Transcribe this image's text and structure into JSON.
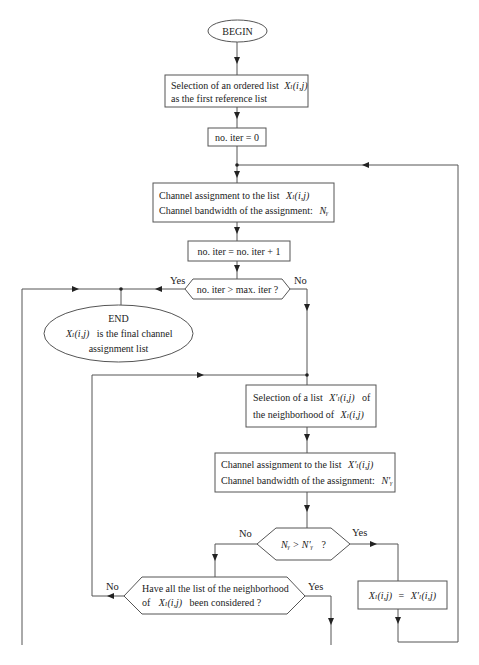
{
  "diagram": {
    "type": "flowchart",
    "colors": {
      "line": "#555555",
      "text": "#222222",
      "background": "#ffffff"
    },
    "nodes": {
      "begin": {
        "label": "BEGIN"
      },
      "select_ordered": {
        "line1": "Selection of an ordered list",
        "math1": "Xₗ(i,j)",
        "line2": "as the first reference list"
      },
      "init_iter": {
        "label": "no. iter = 0"
      },
      "assign_ref": {
        "line1": "Channel assignment to the list",
        "math1": "Xₗ(i,j)",
        "line2": "Channel bandwidth of the assignment:",
        "math2": "Nᵧ"
      },
      "increment_iter": {
        "label": "no. iter = no. iter + 1"
      },
      "check_iter": {
        "label": "no. iter > max. iter  ?",
        "yes": "Yes",
        "no": "No"
      },
      "end": {
        "title": "END",
        "math": "Xₗ(i,j)",
        "line1": "is the final channel",
        "line2": "assignment list"
      },
      "select_neighbor": {
        "line1": "Selection of a list",
        "math1": "X'ₗ(i,j)",
        "line1b": "of",
        "line2": "the neighborhood of",
        "math2": "Xₗ(i,j)"
      },
      "assign_neighbor": {
        "line1": "Channel assignment to the list",
        "math1": "X'ₗ(i,j)",
        "line2": "Channel bandwidth of the assignment:",
        "math2": "N'ᵧ"
      },
      "compare_bw": {
        "math": "Nᵧ > N'ᵧ",
        "q": "?",
        "yes": "Yes",
        "no": "No"
      },
      "replace_ref": {
        "lhs": "Xₗ(i,j)",
        "eq": "=",
        "rhs": "X'ₗ(i,j)"
      },
      "check_all": {
        "line1": "Have all the list of the neighborhood",
        "pre": "of",
        "math": "Xₗ(i,j)",
        "line2": "been considered  ?",
        "yes": "Yes",
        "no": "No"
      }
    }
  }
}
